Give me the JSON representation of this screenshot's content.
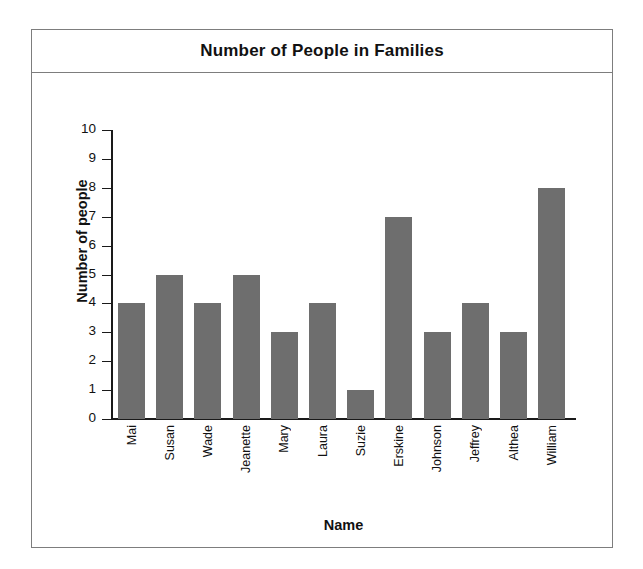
{
  "chart_data": {
    "type": "bar",
    "title": "Number of People in Families",
    "xlabel": "Name",
    "ylabel": "Number of people",
    "categories": [
      "Mai",
      "Susan",
      "Wade",
      "Jeanette",
      "Mary",
      "Laura",
      "Suzie",
      "Erskine",
      "Johnson",
      "Jeffrey",
      "Althea",
      "William"
    ],
    "values": [
      4,
      5,
      4,
      5,
      3,
      4,
      1,
      7,
      3,
      4,
      3,
      8
    ],
    "ylim": [
      0,
      10
    ],
    "ytick_labels": [
      "10",
      "9",
      "8",
      "7",
      "6",
      "5",
      "4",
      "3",
      "2",
      "1",
      "0"
    ],
    "ytick_values": [
      10,
      9,
      8,
      7,
      6,
      5,
      4,
      3,
      2,
      1,
      0
    ],
    "grid": false,
    "legend": "none",
    "bar_color": "#6e6e6e",
    "axis_color": "#1a1a1a",
    "frame_color": "#7d7d7d",
    "background": "#ffffff"
  }
}
